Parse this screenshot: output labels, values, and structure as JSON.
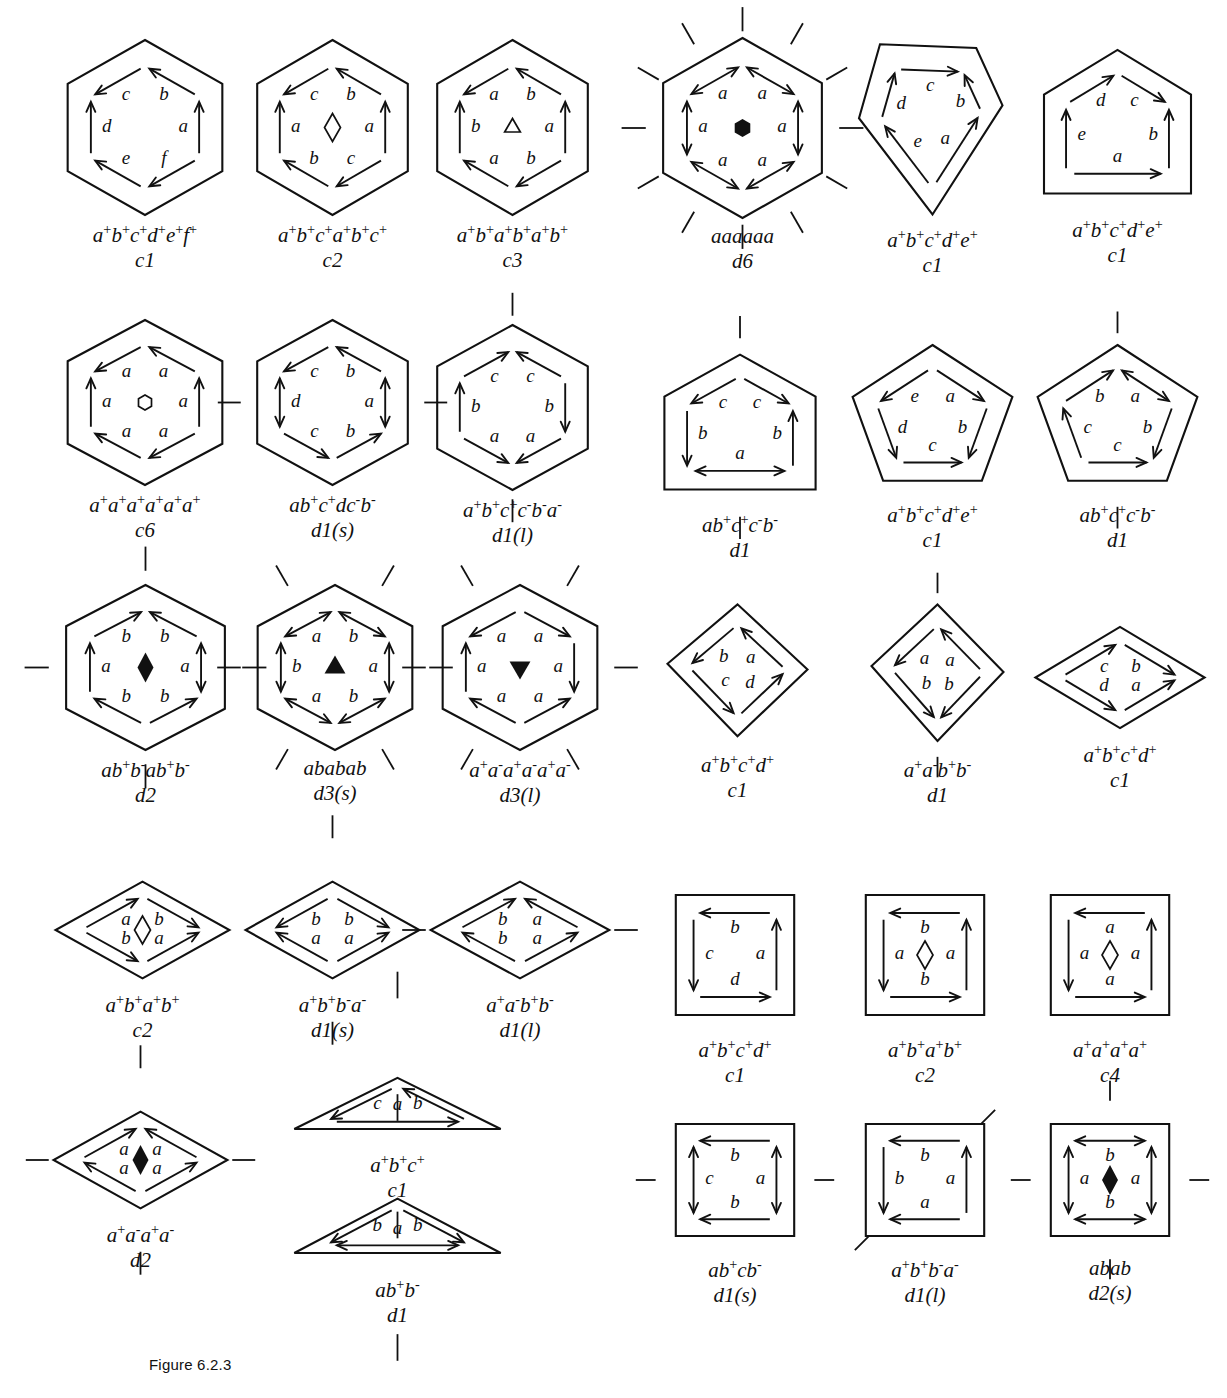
{
  "figure": {
    "caption": "Figure 6.2.3"
  },
  "tiles": [
    {
      "id": "t1",
      "shape": "hexagon",
      "word": "a+b+c+d+e+f+",
      "group": "c1",
      "center_mark": "none",
      "edge_labels": [
        "a",
        "b",
        "c",
        "d",
        "e",
        "f"
      ],
      "mirrors": 0
    },
    {
      "id": "t2",
      "shape": "hexagon",
      "word": "a+b+c+a+b+c+",
      "group": "c2",
      "center_mark": "open-diamond",
      "edge_labels": [
        "a",
        "b",
        "c",
        "a",
        "b",
        "c"
      ],
      "mirrors": 0
    },
    {
      "id": "t3",
      "shape": "hexagon",
      "word": "a+b+a+b+a+b+",
      "group": "c3",
      "center_mark": "open-triangle",
      "edge_labels": [
        "a",
        "b",
        "a",
        "b",
        "a",
        "b"
      ],
      "mirrors": 0
    },
    {
      "id": "t4",
      "shape": "hexagon",
      "word": "aaaaaa",
      "group": "d6",
      "center_mark": "solid-hexagon",
      "edge_labels": [
        "a",
        "a",
        "a",
        "a",
        "a",
        "a"
      ],
      "mirrors": 12
    },
    {
      "id": "t5",
      "shape": "kite5",
      "word": "a+b+c+d+e+",
      "group": "c1",
      "center_mark": "none",
      "edge_labels": [
        "a",
        "b",
        "c",
        "d",
        "e"
      ],
      "mirrors": 0
    },
    {
      "id": "t6",
      "shape": "house5",
      "word": "a+b+c+d+e+",
      "group": "c1",
      "center_mark": "none",
      "edge_labels": [
        "a",
        "b",
        "c",
        "d",
        "e"
      ],
      "mirrors": 0
    },
    {
      "id": "t7",
      "shape": "hexagon",
      "word": "a+a+a+a+a+a+",
      "group": "c6",
      "center_mark": "open-hexagon",
      "edge_labels": [
        "a",
        "a",
        "a",
        "a",
        "a",
        "a"
      ],
      "mirrors": 0
    },
    {
      "id": "t8",
      "shape": "hexagon",
      "word": "ab+c+dc-b-",
      "group": "d1(s)",
      "center_mark": "none",
      "edge_labels": [
        "a",
        "b",
        "c",
        "d",
        "c",
        "b"
      ],
      "mirrors": 2
    },
    {
      "id": "t9",
      "shape": "hexagon",
      "word": "a+b+c+c-b-a-",
      "group": "d1(l)",
      "center_mark": "none",
      "edge_labels": [
        "a",
        "b",
        "c",
        "c",
        "b",
        "a"
      ],
      "mirrors": 2
    },
    {
      "id": "t10",
      "shape": "house5",
      "word": "ab+c+c-b-",
      "group": "d1",
      "center_mark": "none",
      "edge_labels": [
        "a",
        "b",
        "c",
        "c",
        "b"
      ],
      "mirrors": 2
    },
    {
      "id": "t11",
      "shape": "pentagon",
      "word": "a+b+c+d+e+",
      "group": "c1",
      "center_mark": "none",
      "edge_labels": [
        "a",
        "b",
        "c",
        "d",
        "e"
      ],
      "mirrors": 0
    },
    {
      "id": "t12",
      "shape": "pentagon",
      "word": "ab+c+c-b-",
      "group": "d1",
      "center_mark": "none",
      "edge_labels": [
        "a",
        "b",
        "c",
        "c",
        "b"
      ],
      "mirrors": 2
    },
    {
      "id": "t13",
      "shape": "hexagon",
      "word": "ab+b-ab+b-",
      "group": "d2",
      "center_mark": "solid-diamond",
      "edge_labels": [
        "a",
        "b",
        "b",
        "a",
        "b",
        "b"
      ],
      "mirrors": 4
    },
    {
      "id": "t14",
      "shape": "hexagon",
      "word": "ababab",
      "group": "d3(s)",
      "center_mark": "solid-triangle",
      "edge_labels": [
        "a",
        "b",
        "a",
        "b",
        "a",
        "b"
      ],
      "mirrors": 6
    },
    {
      "id": "t15",
      "shape": "hexagon",
      "word": "a+a-a+a-a+a-",
      "group": "d3(l)",
      "center_mark": "solid-triangle-down",
      "edge_labels": [
        "a",
        "a",
        "a",
        "a",
        "a",
        "a"
      ],
      "mirrors": 6
    },
    {
      "id": "t16",
      "shape": "kite4",
      "word": "a+b+c+d+",
      "group": "c1",
      "center_mark": "none",
      "edge_labels": [
        "a",
        "b",
        "c",
        "d"
      ],
      "mirrors": 0
    },
    {
      "id": "t17",
      "shape": "kite4",
      "word": "a+a-b+b-",
      "group": "d1",
      "center_mark": "none",
      "edge_labels": [
        "a",
        "a",
        "b",
        "b"
      ],
      "mirrors": 2
    },
    {
      "id": "t18",
      "shape": "rhombus",
      "word": "a+b+c+d+",
      "group": "c1",
      "center_mark": "none",
      "edge_labels": [
        "a",
        "b",
        "c",
        "d"
      ],
      "mirrors": 0
    },
    {
      "id": "t19",
      "shape": "rhombus",
      "word": "a+b+a+b+",
      "group": "c2",
      "center_mark": "open-diamond",
      "edge_labels": [
        "a",
        "b",
        "a",
        "b"
      ],
      "mirrors": 0
    },
    {
      "id": "t20",
      "shape": "rhombus",
      "word": "a+b+b-a-",
      "group": "d1(s)",
      "center_mark": "none",
      "edge_labels": [
        "a",
        "b",
        "b",
        "a"
      ],
      "mirrors": 2
    },
    {
      "id": "t21",
      "shape": "rhombus",
      "word": "a+a-b+b-",
      "group": "d1(l)",
      "center_mark": "none",
      "edge_labels": [
        "a",
        "a",
        "b",
        "b"
      ],
      "mirrors": 2
    },
    {
      "id": "t22",
      "shape": "square",
      "word": "a+b+c+d+",
      "group": "c1",
      "center_mark": "none",
      "edge_labels": [
        "a",
        "b",
        "c",
        "d"
      ],
      "mirrors": 0
    },
    {
      "id": "t23",
      "shape": "square",
      "word": "a+b+a+b+",
      "group": "c2",
      "center_mark": "open-diamond",
      "edge_labels": [
        "a",
        "b",
        "a",
        "b"
      ],
      "mirrors": 0
    },
    {
      "id": "t24",
      "shape": "square",
      "word": "a+a+a+a+",
      "group": "c4",
      "center_mark": "open-diamond",
      "edge_labels": [
        "a",
        "a",
        "a",
        "a"
      ],
      "mirrors": 0
    },
    {
      "id": "t25",
      "shape": "rhombus",
      "word": "a+a-a+a-",
      "group": "d2",
      "center_mark": "solid-diamond",
      "edge_labels": [
        "a",
        "a",
        "a",
        "a"
      ],
      "mirrors": 4
    },
    {
      "id": "t26",
      "shape": "triangle",
      "word": "a+b+c+",
      "group": "c1",
      "center_mark": "none",
      "edge_labels": [
        "a",
        "b",
        "c"
      ],
      "mirrors": 0
    },
    {
      "id": "t27",
      "shape": "triangle",
      "word": "ab+b-",
      "group": "d1",
      "center_mark": "none",
      "edge_labels": [
        "a",
        "b",
        "b"
      ],
      "mirrors": 2
    },
    {
      "id": "t28",
      "shape": "square",
      "word": "ab+cb-",
      "group": "d1(s)",
      "center_mark": "none",
      "edge_labels": [
        "a",
        "b",
        "c",
        "b"
      ],
      "mirrors": 2
    },
    {
      "id": "t29",
      "shape": "square",
      "word": "a+b+b-a-",
      "group": "d1(l)",
      "center_mark": "none",
      "edge_labels": [
        "a",
        "b",
        "b",
        "a"
      ],
      "mirrors": 2
    },
    {
      "id": "t30",
      "shape": "square",
      "word": "abab",
      "group": "d2(s)",
      "center_mark": "solid-diamond",
      "edge_labels": [
        "a",
        "b",
        "a",
        "b"
      ],
      "mirrors": 4
    }
  ]
}
